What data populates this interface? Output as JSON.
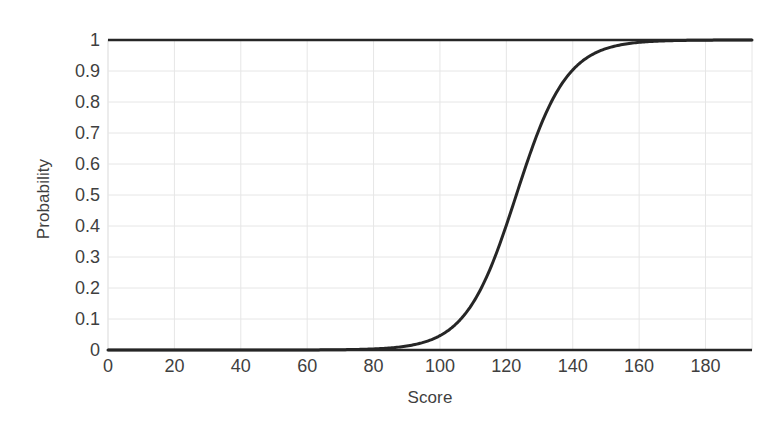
{
  "chart_data": {
    "type": "line",
    "title": "",
    "xlabel": "Score",
    "ylabel": "Probability",
    "xlim": [
      0,
      194
    ],
    "ylim": [
      0,
      1
    ],
    "grid": true,
    "legend": null,
    "x_ticks": [
      "0",
      "20",
      "40",
      "60",
      "80",
      "100",
      "120",
      "140",
      "160",
      "180"
    ],
    "x_tick_values": [
      0,
      20,
      40,
      60,
      80,
      100,
      120,
      140,
      160,
      180
    ],
    "y_ticks": [
      "0",
      "0.1",
      "0.2",
      "0.3",
      "0.4",
      "0.5",
      "0.6",
      "0.7",
      "0.8",
      "0.9",
      "1"
    ],
    "y_tick_values": [
      0,
      0.1,
      0.2,
      0.3,
      0.4,
      0.5,
      0.6,
      0.7,
      0.8,
      0.9,
      1
    ],
    "series": [
      {
        "name": "Probability",
        "color": "#262626",
        "line_width": 3,
        "model": "logistic",
        "midpoint": 123,
        "slope_scale": 7.6,
        "x": [
          0,
          10,
          20,
          30,
          40,
          50,
          60,
          70,
          80,
          85,
          90,
          95,
          100,
          103,
          106,
          109,
          112,
          115,
          118,
          121,
          123,
          125,
          128,
          131,
          134,
          137,
          140,
          143,
          146,
          150,
          155,
          160,
          165,
          170,
          175,
          180,
          185,
          190,
          194
        ],
        "values": [
          0.0,
          0.0,
          0.0,
          0.0,
          0.0,
          0.0,
          0.001,
          0.001,
          0.003,
          0.005,
          0.009,
          0.018,
          0.034,
          0.049,
          0.069,
          0.097,
          0.133,
          0.181,
          0.239,
          0.309,
          0.361,
          0.415,
          0.5,
          0.585,
          0.665,
          0.737,
          0.799,
          0.849,
          0.888,
          0.927,
          0.961,
          0.98,
          0.99,
          0.995,
          0.997,
          0.999,
          0.999,
          1.0,
          1.0
        ]
      }
    ]
  },
  "axes": {
    "gridline_color": "#e6e6e6",
    "axis_line_color": "#262626",
    "tick_label_color": "#3f3f3f",
    "background": "#ffffff"
  }
}
